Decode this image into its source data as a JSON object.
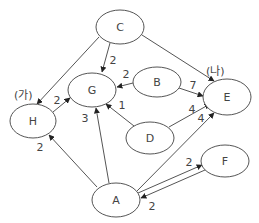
{
  "diagram": {
    "type": "directed-weighted-graph",
    "colors": {
      "stroke": "#555555",
      "text": "#444444",
      "background": "#ffffff"
    },
    "nodes": [
      {
        "id": "C",
        "label": "C",
        "cx": 120,
        "cy": 27,
        "rx": 24,
        "ry": 17
      },
      {
        "id": "G",
        "label": "G",
        "cx": 92,
        "cy": 90,
        "rx": 24,
        "ry": 17
      },
      {
        "id": "B",
        "label": "B",
        "cx": 157,
        "cy": 82,
        "rx": 24,
        "ry": 15
      },
      {
        "id": "E",
        "label": "E",
        "cx": 227,
        "cy": 97,
        "rx": 24,
        "ry": 18
      },
      {
        "id": "H",
        "label": "H",
        "cx": 33,
        "cy": 121,
        "rx": 23,
        "ry": 17
      },
      {
        "id": "D",
        "label": "D",
        "cx": 150,
        "cy": 138,
        "rx": 24,
        "ry": 16
      },
      {
        "id": "F",
        "label": "F",
        "cx": 225,
        "cy": 161,
        "rx": 24,
        "ry": 16
      },
      {
        "id": "A",
        "label": "A",
        "cx": 116,
        "cy": 200,
        "rx": 24,
        "ry": 17
      }
    ],
    "edges": [
      {
        "from": "C",
        "to": "G",
        "weight": "2",
        "x1": 110,
        "y1": 43,
        "x2": 102,
        "y2": 72,
        "lx": 113,
        "ly": 64
      },
      {
        "from": "C",
        "to": "H",
        "weight": "",
        "x1": 99,
        "y1": 37,
        "x2": 37,
        "y2": 104,
        "lx": 0,
        "ly": 0
      },
      {
        "from": "C",
        "to": "E",
        "weight": "",
        "x1": 142,
        "y1": 35,
        "x2": 214,
        "y2": 81,
        "lx": 0,
        "ly": 0
      },
      {
        "from": "H",
        "to": "G",
        "weight": "2",
        "x1": 53,
        "y1": 112,
        "x2": 70,
        "y2": 98,
        "lx": 57,
        "ly": 104
      },
      {
        "from": "B",
        "to": "G",
        "weight": "2",
        "x1": 133,
        "y1": 83,
        "x2": 117,
        "y2": 87,
        "lx": 126,
        "ly": 78
      },
      {
        "from": "B",
        "to": "E",
        "weight": "7",
        "x1": 179,
        "y1": 88,
        "x2": 203,
        "y2": 96,
        "lx": 193,
        "ly": 89
      },
      {
        "from": "D",
        "to": "G",
        "weight": "1",
        "x1": 134,
        "y1": 126,
        "x2": 106,
        "y2": 104,
        "lx": 122,
        "ly": 109
      },
      {
        "from": "D",
        "to": "E",
        "weight": "4",
        "x1": 169,
        "y1": 127,
        "x2": 210,
        "y2": 104,
        "lx": 192,
        "ly": 113
      },
      {
        "from": "A",
        "to": "G",
        "weight": "3",
        "x1": 109,
        "y1": 183,
        "x2": 96,
        "y2": 108,
        "lx": 85,
        "ly": 122
      },
      {
        "from": "A",
        "to": "H",
        "weight": "2",
        "x1": 97,
        "y1": 187,
        "x2": 49,
        "y2": 135,
        "lx": 40,
        "ly": 151
      },
      {
        "from": "A",
        "to": "E",
        "weight": "4",
        "x1": 137,
        "y1": 191,
        "x2": 214,
        "y2": 113,
        "lx": 201,
        "ly": 122
      },
      {
        "from": "A",
        "to": "F",
        "weight": "2",
        "x1": 138,
        "y1": 193,
        "x2": 202,
        "y2": 165,
        "lx": 189,
        "ly": 166
      },
      {
        "from": "F",
        "to": "A",
        "weight": "2",
        "x1": 205,
        "y1": 170,
        "x2": 141,
        "y2": 198,
        "lx": 152,
        "ly": 210
      }
    ],
    "annotations": [
      {
        "id": "ga",
        "text": "(가)",
        "x": 14,
        "y": 99
      },
      {
        "id": "na",
        "text": "(나)",
        "x": 206,
        "y": 75
      }
    ]
  }
}
